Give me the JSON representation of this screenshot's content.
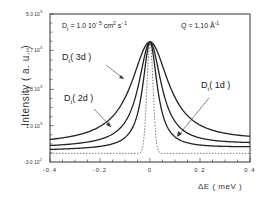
{
  "chart_data": {
    "type": "line",
    "title": "",
    "xlabel": "ΔE ( meV )",
    "ylabel": "Intensity ( a. u. )",
    "xlim": [
      -0.4,
      0.4
    ],
    "ylim": [
      -300,
      5000
    ],
    "x_ticks": [
      "-0.4",
      "-0.2",
      "0",
      "0.2",
      "0.4"
    ],
    "y_ticks": [
      {
        "mant": "5.0",
        "exp": "3",
        "value": 5000
      },
      {
        "mant": "3.7",
        "exp": "3",
        "value": 3700
      },
      {
        "mant": "2.3",
        "exp": "3",
        "value": 2300
      },
      {
        "mant": "1.0",
        "exp": "3",
        "value": 1000
      },
      {
        "mant": "-3.0",
        "exp": "2",
        "value": -300
      }
    ],
    "grid": false,
    "annotations": {
      "diffusion": {
        "symbol": "D",
        "sub": "t",
        "text": " = 1.0  10",
        "exp": "- 5",
        "unit": " cm",
        "unit_exp": "2",
        "unit2": " s",
        "unit2_exp": "- 1"
      },
      "q": {
        "text": "Q = 1.10 Å",
        "exp": "-1"
      }
    },
    "series": [
      {
        "name": "D_t ( 3d )",
        "label": "( 3d )",
        "style": "solid",
        "peak": 4000,
        "baseline_left": 330,
        "baseline_right": 450,
        "hwhm": 0.09
      },
      {
        "name": "D_t ( 2d )",
        "label": "( 2d )",
        "style": "solid",
        "peak": 4000,
        "baseline_left": 220,
        "baseline_right": 330,
        "hwhm": 0.055
      },
      {
        "name": "D_t ( 1d )",
        "label": "( 1d )",
        "style": "solid",
        "peak": 4000,
        "baseline_left": 120,
        "baseline_right": 220,
        "hwhm": 0.035
      },
      {
        "name": "resolution",
        "label": "",
        "style": "dotted",
        "peak": 4000,
        "baseline_left": 10,
        "baseline_right": 10,
        "hwhm": 0.012
      }
    ],
    "x_samples": [
      -0.4,
      -0.3,
      -0.2,
      -0.15,
      -0.1,
      -0.08,
      -0.06,
      -0.04,
      -0.02,
      0,
      0.02,
      0.04,
      0.06,
      0.08,
      0.1,
      0.15,
      0.2,
      0.3,
      0.4
    ]
  }
}
